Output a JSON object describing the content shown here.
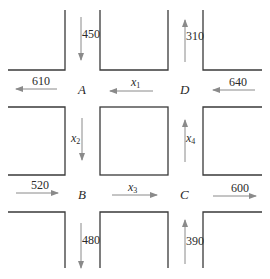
{
  "diagram": {
    "type": "traffic-flow-network",
    "nodes": {
      "A": "A",
      "B": "B",
      "C": "C",
      "D": "D"
    },
    "external_flows": {
      "A_in_top": "450",
      "A_out_left": "610",
      "D_out_top": "310",
      "D_in_right": "640",
      "B_in_left": "520",
      "B_out_bottom": "480",
      "C_out_right": "600",
      "C_in_bottom": "390"
    },
    "internal_flows": {
      "x1": {
        "base": "x",
        "sub": "1",
        "from": "D",
        "to": "A"
      },
      "x2": {
        "base": "x",
        "sub": "2",
        "from": "A",
        "to": "B"
      },
      "x3": {
        "base": "x",
        "sub": "3",
        "from": "B",
        "to": "C"
      },
      "x4": {
        "base": "x",
        "sub": "4",
        "from": "C",
        "to": "D"
      }
    },
    "colors": {
      "street": "#3a3a3a",
      "arrow": "#8a8a8a",
      "text": "#2a2a2a"
    }
  }
}
